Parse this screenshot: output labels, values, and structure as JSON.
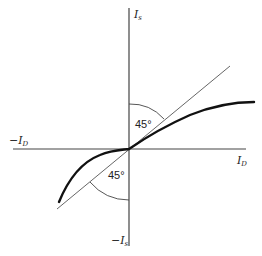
{
  "diagram": {
    "axes": {
      "y_positive": {
        "main": "I",
        "sub": "s",
        "prefix": ""
      },
      "y_negative": {
        "main": "I",
        "sub": "s",
        "prefix": "−"
      },
      "x_positive": {
        "main": "I",
        "sub": "D",
        "prefix": ""
      },
      "x_negative": {
        "main": "I",
        "sub": "D",
        "prefix": "−"
      }
    },
    "angles": {
      "upper": "45°",
      "lower": "45°"
    },
    "colors": {
      "axis": "#444444",
      "reference_line": "#555555",
      "curve": "#111111",
      "arc": "#444444",
      "text": "#222222",
      "background": "#ffffff"
    }
  }
}
